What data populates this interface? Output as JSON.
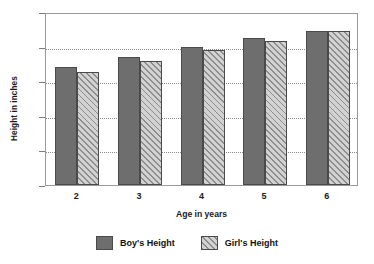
{
  "chart_data": {
    "type": "bar",
    "title": "",
    "xlabel": "Age in years",
    "ylabel": "Height in inches",
    "categories": [
      "2",
      "3",
      "4",
      "5",
      "6"
    ],
    "series": [
      {
        "name": "Boy's Height",
        "values": [
          34,
          37,
          39.8,
          42.5,
          44.6
        ],
        "color": "#6e6e6e",
        "fill": "solid"
      },
      {
        "name": "Girl's Height",
        "values": [
          32.8,
          35.8,
          39,
          41.5,
          44.6
        ],
        "color": "#b9b9b9",
        "fill": "diagonal-hatch"
      }
    ],
    "ylim": [
      0,
      50
    ],
    "yticks": [
      0,
      10,
      20,
      30,
      40,
      50
    ],
    "ytick_labels": [
      "0",
      "10",
      "20",
      "30",
      "40",
      "50"
    ],
    "grid": "horizontal-dotted",
    "legend_position": "bottom-center"
  },
  "axes": {
    "y_title": "Height in inches",
    "x_title": "Age in years"
  },
  "legend": {
    "items": [
      {
        "label": "Boy's Height",
        "swatch": "solid-gray-swatch"
      },
      {
        "label": "Girl's Height",
        "swatch": "hatched-gray-swatch"
      }
    ]
  }
}
